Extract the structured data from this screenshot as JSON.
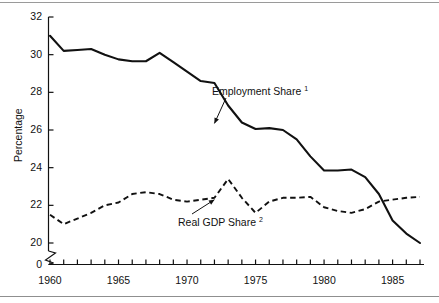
{
  "chart_data": {
    "type": "line",
    "title": "",
    "subtitle": "",
    "xlabel": "",
    "ylabel": "Percentage",
    "xlim": [
      1960,
      1987
    ],
    "ylim": [
      19,
      32
    ],
    "y_axis_break": true,
    "y_break_label": "0",
    "grid": false,
    "legend_position": "inline-annotation",
    "y_ticks": [
      20,
      22,
      24,
      26,
      28,
      30,
      32
    ],
    "y_tick_labels": [
      "20",
      "22",
      "24",
      "26",
      "28",
      "30",
      "32"
    ],
    "x_ticks": [
      1960,
      1961,
      1962,
      1963,
      1964,
      1965,
      1966,
      1967,
      1968,
      1969,
      1970,
      1971,
      1972,
      1973,
      1974,
      1975,
      1976,
      1977,
      1978,
      1979,
      1980,
      1981,
      1982,
      1983,
      1984,
      1985,
      1986,
      1987
    ],
    "x_tick_labels": [
      "1960",
      "1965",
      "1970",
      "1975",
      "1980",
      "1985"
    ],
    "x_labeled_years": [
      1960,
      1965,
      1970,
      1975,
      1980,
      1985
    ],
    "x": [
      1960,
      1961,
      1962,
      1963,
      1964,
      1965,
      1966,
      1967,
      1968,
      1969,
      1970,
      1971,
      1972,
      1973,
      1974,
      1975,
      1976,
      1977,
      1978,
      1979,
      1980,
      1981,
      1982,
      1983,
      1984,
      1985,
      1986,
      1987
    ],
    "series": [
      {
        "name": "Employment Share",
        "footnote": "1",
        "style": "solid",
        "color": "#111111",
        "annotation": "Employment Share¹",
        "values": [
          31.0,
          30.2,
          30.25,
          30.3,
          30.0,
          29.75,
          29.65,
          29.65,
          30.1,
          29.6,
          29.1,
          28.6,
          28.5,
          27.3,
          26.4,
          26.05,
          26.1,
          26.0,
          25.5,
          24.6,
          23.85,
          23.85,
          23.9,
          23.5,
          22.6,
          21.2,
          20.5,
          20.0
        ]
      },
      {
        "name": "Real GDP Share",
        "footnote": "2",
        "style": "dashed",
        "color": "#111111",
        "annotation": "Real GDP Share²",
        "values": [
          21.5,
          21.0,
          21.3,
          21.6,
          22.0,
          22.15,
          22.6,
          22.7,
          22.6,
          22.3,
          22.2,
          22.3,
          22.4,
          23.4,
          22.4,
          21.6,
          22.2,
          22.4,
          22.4,
          22.45,
          21.9,
          21.7,
          21.6,
          21.8,
          22.2,
          22.3,
          22.4,
          22.45
        ]
      }
    ],
    "annotations": [
      {
        "text": "Employment Share¹",
        "target_year": 1972,
        "target_value": 26.35
      },
      {
        "text": "Real GDP Share²",
        "target_year": 1972,
        "target_value": 22.3
      }
    ]
  }
}
